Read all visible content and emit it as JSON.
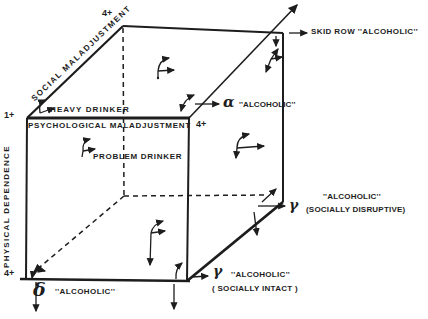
{
  "colors": {
    "background": "#ffffff",
    "ink": "#1d1d1d"
  },
  "ticks": {
    "origin": "1+",
    "social_max": "4+",
    "psychological_max": "4+",
    "physical_max": "4+"
  },
  "axes": {
    "social": "SOCIAL MALADJUSTMENT",
    "psychological": "PSYCHOLOGICAL MALADJUSTMENT",
    "physical": "PHYSICAL DEPENDENCE"
  },
  "labels": {
    "heavy_drinker": "HEAVY DRINKER",
    "problem_drinker": "PROBLEM DRINKER",
    "skid_row": "SKID ROW ''ALCOHOLIC''",
    "alpha_symbol": "α",
    "alpha_text": "''ALCOHOLIC''",
    "gamma_disruptive_symbol": "γ",
    "gamma_disruptive_line1": "''ALCOHOLIC''",
    "gamma_disruptive_line2": "(SOCIALLY DISRUPTIVE)",
    "gamma_intact_symbol": "γ",
    "gamma_intact_line1": "''ALCOHOLIC''",
    "gamma_intact_line2": "( SOCIALLY INTACT )",
    "delta_symbol": "δ",
    "delta_text": "''ALCOHOLIC''"
  }
}
